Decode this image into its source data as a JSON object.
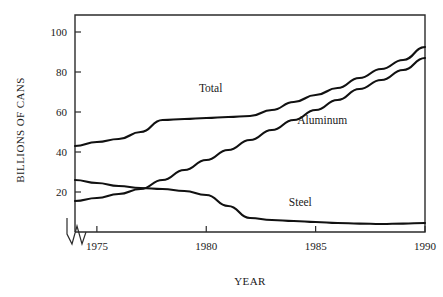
{
  "chart_data": {
    "type": "line",
    "title": "",
    "xlabel": "YEAR",
    "ylabel": "BILLIONS OF CANS",
    "xlim": [
      1974,
      1990
    ],
    "ylim": [
      0,
      108
    ],
    "grid": false,
    "legend_position": "inline-labels",
    "axis_break": "x-axis origin zigzag break",
    "x": [
      1974,
      1975,
      1976,
      1977,
      1978,
      1979,
      1980,
      1981,
      1982,
      1983,
      1984,
      1985,
      1986,
      1987,
      1988,
      1989,
      1990
    ],
    "xticks": [
      "1975",
      "1980",
      "1985",
      "1990"
    ],
    "xtick_values": [
      1975,
      1980,
      1985,
      1990
    ],
    "yticks": [
      "20",
      "40",
      "60",
      "80",
      "100"
    ],
    "ytick_values": [
      20,
      40,
      60,
      80,
      100
    ],
    "series": [
      {
        "name": "Total",
        "label": "Total",
        "color": "#111111",
        "values": [
          43,
          45,
          46.5,
          50,
          56,
          56.5,
          57,
          57.5,
          58,
          61,
          65,
          68.5,
          72,
          77,
          81.5,
          86,
          92.5
        ]
      },
      {
        "name": "Aluminum",
        "label": "Aluminum",
        "color": "#111111",
        "values": [
          15.5,
          17,
          19,
          21.5,
          26,
          31,
          36,
          41,
          46,
          51,
          56,
          61,
          66,
          71.5,
          76,
          81,
          87
        ]
      },
      {
        "name": "Steel",
        "label": "Steel",
        "color": "#111111",
        "values": [
          26,
          24.5,
          23,
          22,
          21.5,
          20.5,
          18.5,
          13,
          7,
          6,
          5.5,
          5,
          4.5,
          4.2,
          4,
          4.2,
          4.5
        ]
      }
    ],
    "annotations": [
      {
        "text": "Total",
        "x": 1980.2,
        "y": 70
      },
      {
        "text": "Aluminum",
        "x": 1985.3,
        "y": 54
      },
      {
        "text": "Steel",
        "x": 1984.3,
        "y": 13
      }
    ]
  }
}
